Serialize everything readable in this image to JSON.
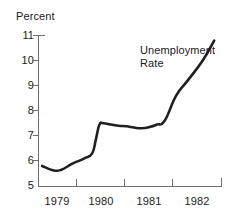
{
  "chart_data": {
    "type": "line",
    "title": "",
    "subtitle": "",
    "xlabel": "",
    "ylabel": "Percent",
    "ylim": [
      5,
      11
    ],
    "xlim": [
      1978.75,
      1982.75
    ],
    "grid": false,
    "legend_position": "inline-annotation",
    "y_ticks": [
      "11",
      "10",
      "9",
      "8",
      "7",
      "6",
      "5"
    ],
    "y_tick_values": [
      11,
      10,
      9,
      8,
      7,
      6,
      5
    ],
    "x_ticks": [
      "1979",
      "1980",
      "1981",
      "1982"
    ],
    "x_tick_values": [
      1979,
      1980,
      1981,
      1982
    ],
    "annotations": [
      {
        "text_line_1": "Unemployment",
        "text_line_2": "Rate",
        "x": 1981.0,
        "y": 10.2
      }
    ],
    "series": [
      {
        "name": "Unemployment Rate",
        "color": "#231f20",
        "x": [
          1978.83,
          1979.08,
          1979.25,
          1979.5,
          1979.75,
          1979.92,
          1980.0,
          1980.08,
          1980.17,
          1980.33,
          1980.5,
          1980.67,
          1980.83,
          1981.0,
          1981.17,
          1981.33,
          1981.5,
          1981.75,
          1982.0,
          1982.33,
          1982.58
        ],
        "values": [
          5.8,
          5.62,
          5.65,
          5.9,
          6.1,
          6.3,
          6.85,
          7.45,
          7.5,
          7.45,
          7.4,
          7.38,
          7.33,
          7.3,
          7.35,
          7.45,
          7.6,
          8.6,
          9.2,
          10.0,
          10.8
        ]
      }
    ]
  },
  "figure": {
    "y_axis_title": "Percent",
    "series_label_line_1": "Unemployment",
    "series_label_line_2": "Rate"
  }
}
